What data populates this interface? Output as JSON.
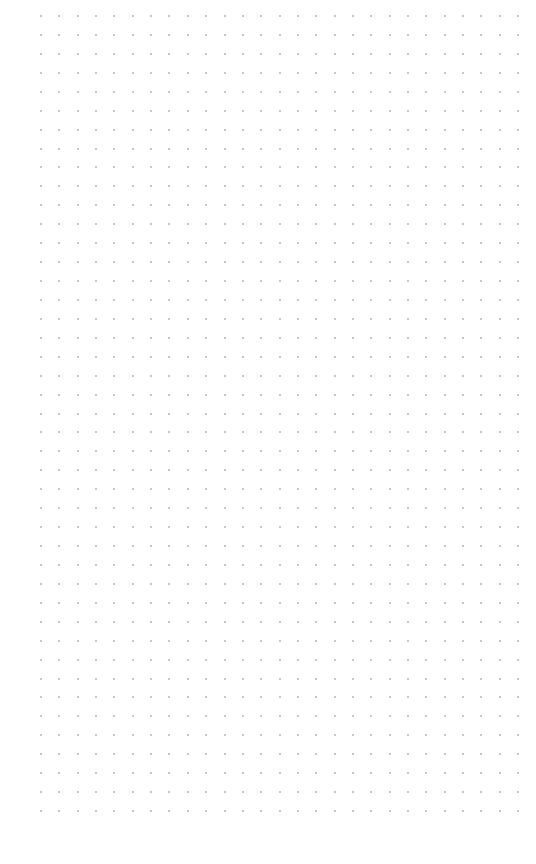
{
  "canvas": {
    "background": "#ffffff",
    "dot_color": "#b4b4b4",
    "columns": 27,
    "rows": 43,
    "origin_x": 41,
    "origin_y": 16,
    "spacing_x": 18.35,
    "spacing_y": 18.93
  }
}
